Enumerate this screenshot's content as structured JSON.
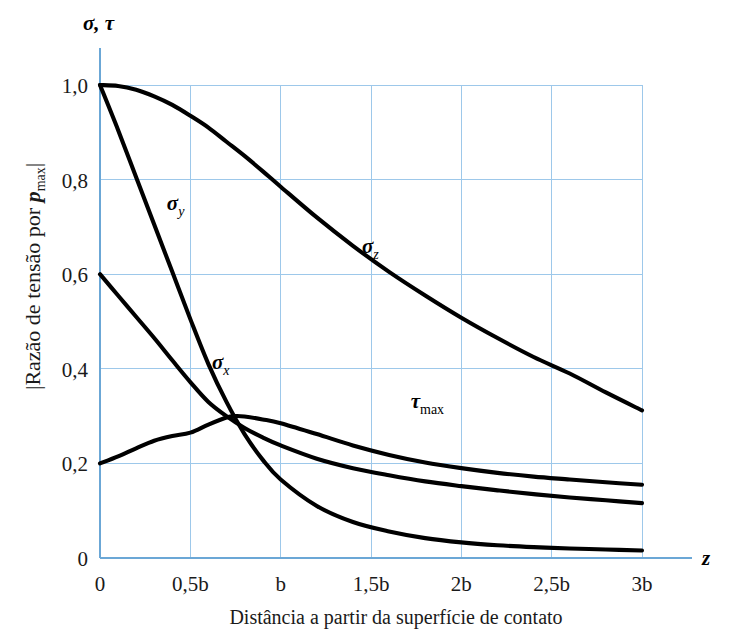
{
  "chart_data": {
    "type": "line",
    "title": "",
    "xlabel": "Distância a partir da superfície de contato",
    "ylabel": "|Razão de tensão por p_max|",
    "ylabel_parts": {
      "prefix": "|Razão de tensão por ",
      "symbol": "p",
      "subscript": "max",
      "suffix": "|"
    },
    "axis_corner_label": "σ, τ",
    "x_axis_variable": "z",
    "xlim": [
      0,
      3
    ],
    "ylim": [
      0,
      1.0
    ],
    "grid": true,
    "legend": "inline-annotations",
    "x_unit": "b",
    "xticks": [
      0,
      0.5,
      1,
      1.5,
      2,
      2.5,
      3
    ],
    "xticklabels": [
      "0",
      "0,5b",
      "b",
      "1,5b",
      "2b",
      "2,5b",
      "3b"
    ],
    "yticks": [
      0,
      0.2,
      0.4,
      0.6,
      0.8,
      1.0
    ],
    "yticklabels": [
      "0",
      "0,2",
      "0,4",
      "0,6",
      "0,8",
      "1,0"
    ],
    "series": [
      {
        "name": "sigma_z",
        "label_symbol": "σ",
        "label_subscript": "z",
        "label_x": 1.45,
        "label_y": 0.645,
        "x": [
          0,
          0.1,
          0.2,
          0.3,
          0.4,
          0.5,
          0.6,
          0.7,
          0.8,
          0.9,
          1.0,
          1.2,
          1.4,
          1.6,
          1.8,
          2.0,
          2.2,
          2.4,
          2.6,
          2.8,
          3.0
        ],
        "values": [
          1.0,
          0.998,
          0.99,
          0.976,
          0.958,
          0.935,
          0.91,
          0.88,
          0.85,
          0.818,
          0.785,
          0.72,
          0.66,
          0.605,
          0.555,
          0.508,
          0.465,
          0.425,
          0.39,
          0.35,
          0.312
        ]
      },
      {
        "name": "sigma_y",
        "label_symbol": "σ",
        "label_subscript": "y",
        "label_x": 0.37,
        "label_y": 0.735,
        "x": [
          0,
          0.1,
          0.2,
          0.3,
          0.4,
          0.5,
          0.6,
          0.7,
          0.8,
          0.9,
          1.0,
          1.2,
          1.4,
          1.6,
          1.8,
          2.0,
          2.2,
          2.4,
          2.6,
          2.8,
          3.0
        ],
        "values": [
          1.0,
          0.905,
          0.805,
          0.705,
          0.605,
          0.505,
          0.41,
          0.33,
          0.262,
          0.208,
          0.166,
          0.11,
          0.076,
          0.056,
          0.042,
          0.033,
          0.027,
          0.023,
          0.02,
          0.018,
          0.016
        ]
      },
      {
        "name": "sigma_x",
        "label_symbol": "σ",
        "label_subscript": "x",
        "label_x": 0.62,
        "label_y": 0.4,
        "x": [
          0,
          0.1,
          0.2,
          0.3,
          0.4,
          0.5,
          0.6,
          0.7,
          0.8,
          0.9,
          1.0,
          1.2,
          1.4,
          1.6,
          1.8,
          2.0,
          2.2,
          2.4,
          2.6,
          2.8,
          3.0
        ],
        "values": [
          0.6,
          0.555,
          0.51,
          0.465,
          0.418,
          0.372,
          0.33,
          0.3,
          0.275,
          0.255,
          0.238,
          0.21,
          0.19,
          0.175,
          0.162,
          0.152,
          0.143,
          0.135,
          0.128,
          0.122,
          0.116
        ]
      },
      {
        "name": "tau_max",
        "label_symbol": "τ",
        "label_subscript": "max",
        "label_x": 1.72,
        "label_y": 0.318,
        "x": [
          0,
          0.1,
          0.2,
          0.3,
          0.4,
          0.5,
          0.6,
          0.7,
          0.75,
          0.8,
          0.9,
          1.0,
          1.2,
          1.4,
          1.6,
          1.8,
          2.0,
          2.2,
          2.4,
          2.6,
          2.8,
          3.0
        ],
        "values": [
          0.2,
          0.215,
          0.232,
          0.248,
          0.258,
          0.265,
          0.282,
          0.297,
          0.3,
          0.299,
          0.293,
          0.285,
          0.262,
          0.238,
          0.218,
          0.202,
          0.19,
          0.18,
          0.172,
          0.166,
          0.16,
          0.155
        ]
      }
    ]
  },
  "colors": {
    "grid": "#9dc8ea",
    "axis": "#6ba7d6",
    "curve": "#000000",
    "text": "#1a1a1a",
    "background": "#ffffff"
  }
}
